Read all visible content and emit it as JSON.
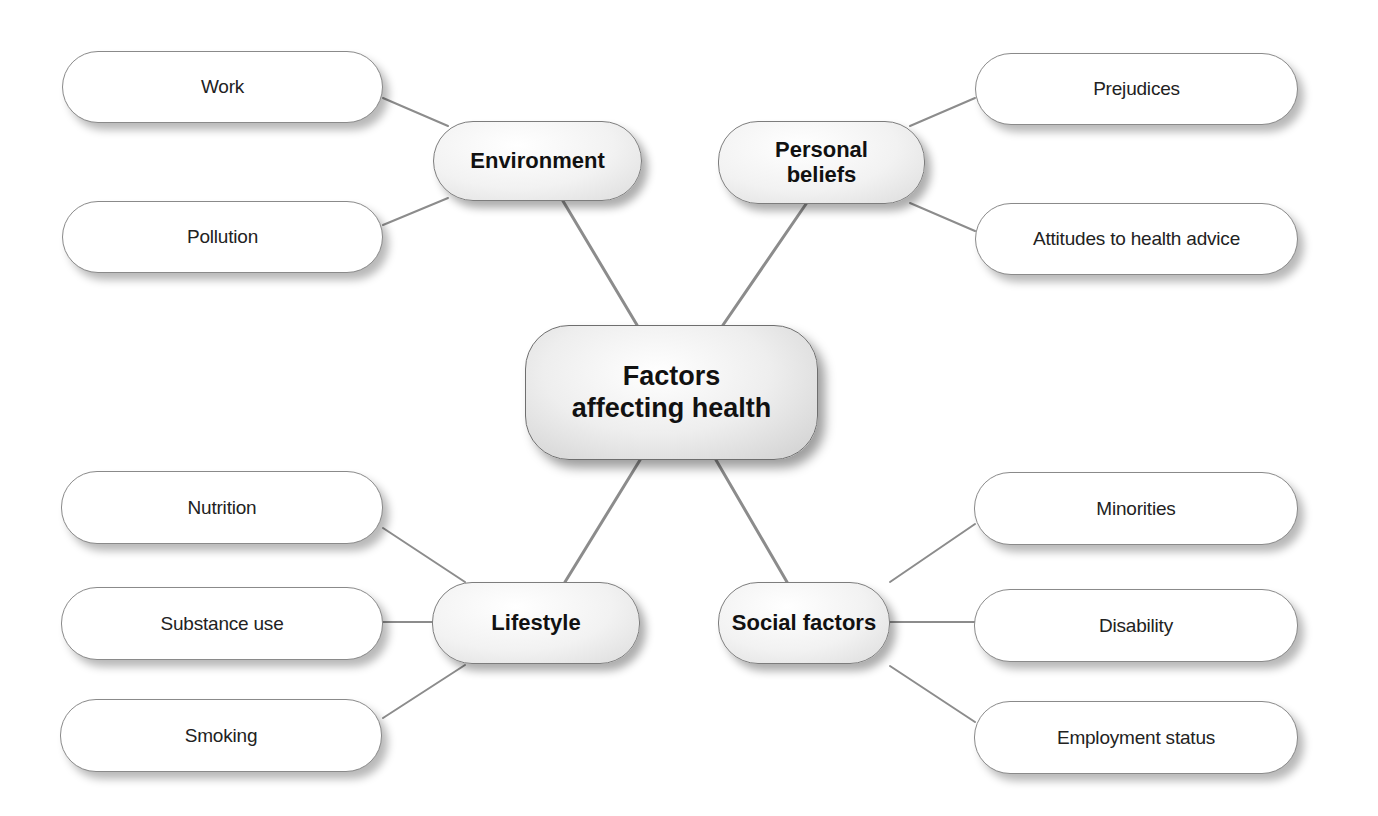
{
  "diagram": {
    "type": "mind-map",
    "center": {
      "label": "Factors\naffecting health"
    },
    "branches": [
      {
        "id": "environment",
        "label": "Environment",
        "leaves": [
          "Work",
          "Pollution"
        ]
      },
      {
        "id": "personal-beliefs",
        "label": "Personal\nbeliefs",
        "leaves": [
          "Prejudices",
          "Attitudes to health advice"
        ]
      },
      {
        "id": "lifestyle",
        "label": "Lifestyle",
        "leaves": [
          "Nutrition",
          "Substance use",
          "Smoking"
        ]
      },
      {
        "id": "social-factors",
        "label": "Social factors",
        "leaves": [
          "Minorities",
          "Disability",
          "Employment status"
        ]
      }
    ],
    "colors": {
      "connector": "#8c8c8c",
      "border": "#8a8a8a",
      "background": "#ffffff"
    }
  }
}
